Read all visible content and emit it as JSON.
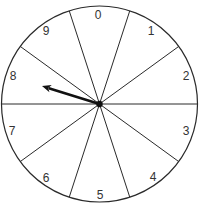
{
  "diagram": {
    "type": "spinner",
    "sector_count": 10,
    "center": {
      "x": 99.5,
      "y": 104
    },
    "radius": 98,
    "colors": {
      "line": "#2a2a2a",
      "needle": "#111111",
      "background": "#ffffff"
    },
    "sectors": [
      {
        "label": "0",
        "x": 98,
        "y": 15
      },
      {
        "label": "1",
        "x": 151,
        "y": 31
      },
      {
        "label": "2",
        "x": 186,
        "y": 76
      },
      {
        "label": "3",
        "x": 186,
        "y": 131
      },
      {
        "label": "4",
        "x": 153,
        "y": 177
      },
      {
        "label": "5",
        "x": 100,
        "y": 195
      },
      {
        "label": "6",
        "x": 46,
        "y": 178
      },
      {
        "label": "7",
        "x": 12,
        "y": 131
      },
      {
        "label": "8",
        "x": 13,
        "y": 76
      },
      {
        "label": "9",
        "x": 46,
        "y": 31
      }
    ],
    "needle": {
      "points_to": "8",
      "tip": {
        "x": 42,
        "y": 86
      }
    }
  }
}
